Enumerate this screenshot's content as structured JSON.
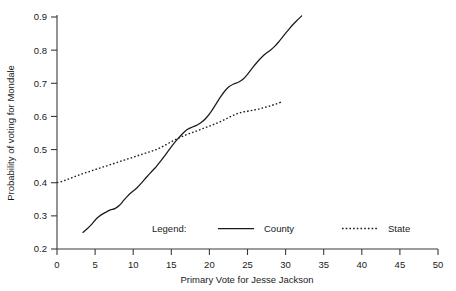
{
  "chart_data": {
    "type": "line",
    "title": "",
    "xlabel": "Primary Vote for Jesse Jackson",
    "ylabel": "Probability of voting for Mondale",
    "xlim": [
      0,
      50
    ],
    "ylim": [
      0.2,
      0.9
    ],
    "xticks": [
      0,
      5,
      10,
      15,
      20,
      25,
      30,
      35,
      40,
      45,
      50
    ],
    "xtick_labels": [
      "0",
      "5",
      "10",
      "15",
      "20",
      "25",
      "30",
      "35",
      "40",
      "45",
      "50"
    ],
    "yticks": [
      0.2,
      0.3,
      0.4,
      0.5,
      0.6,
      0.7,
      0.8,
      0.9
    ],
    "ytick_labels": [
      "0.2",
      "0.3",
      "0.4",
      "0.5",
      "0.6",
      "0.7",
      "0.8",
      "0.9"
    ],
    "grid": false,
    "legend_position": "inside-bottom-center",
    "legend_title": "Legend:",
    "series": [
      {
        "name": "County",
        "style": "solid",
        "color": "#1a1a1a",
        "x": [
          3.4,
          4.0,
          4.6,
          5.2,
          5.8,
          6.4,
          7.0,
          7.6,
          8.2,
          8.8,
          9.4,
          10.0,
          10.6,
          11.2,
          11.8,
          12.4,
          13.0,
          13.6,
          14.2,
          14.8,
          15.4,
          16.0,
          16.6,
          17.2,
          17.8,
          18.4,
          19.0,
          19.6,
          20.2,
          20.8,
          21.4,
          22.0,
          22.6,
          23.2,
          23.8,
          24.4,
          25.0,
          25.6,
          26.2,
          26.8,
          27.4,
          28.0,
          28.6,
          29.2,
          29.8,
          30.4,
          31.0,
          31.6,
          32.1
        ],
        "y": [
          0.25,
          0.262,
          0.276,
          0.292,
          0.303,
          0.311,
          0.318,
          0.322,
          0.332,
          0.348,
          0.363,
          0.375,
          0.387,
          0.402,
          0.418,
          0.433,
          0.448,
          0.465,
          0.483,
          0.502,
          0.52,
          0.536,
          0.551,
          0.562,
          0.568,
          0.574,
          0.583,
          0.596,
          0.614,
          0.635,
          0.657,
          0.676,
          0.69,
          0.698,
          0.703,
          0.712,
          0.727,
          0.745,
          0.762,
          0.777,
          0.79,
          0.8,
          0.812,
          0.828,
          0.845,
          0.862,
          0.878,
          0.892,
          0.903
        ]
      },
      {
        "name": "State",
        "style": "dotted",
        "color": "#1a1a1a",
        "x": [
          0.0,
          0.8,
          1.6,
          2.4,
          3.2,
          4.0,
          4.8,
          5.6,
          6.4,
          7.2,
          8.0,
          8.8,
          9.6,
          10.4,
          11.2,
          12.0,
          12.8,
          13.6,
          14.4,
          15.2,
          16.0,
          16.8,
          17.6,
          18.4,
          19.2,
          20.0,
          20.8,
          21.6,
          22.4,
          23.2,
          24.0,
          24.8,
          25.6,
          26.4,
          27.2,
          28.0,
          28.8,
          29.6
        ],
        "y": [
          0.4,
          0.405,
          0.412,
          0.419,
          0.426,
          0.432,
          0.438,
          0.444,
          0.45,
          0.456,
          0.462,
          0.468,
          0.474,
          0.48,
          0.486,
          0.492,
          0.498,
          0.506,
          0.516,
          0.526,
          0.535,
          0.543,
          0.55,
          0.557,
          0.564,
          0.571,
          0.578,
          0.586,
          0.595,
          0.604,
          0.611,
          0.615,
          0.618,
          0.622,
          0.627,
          0.632,
          0.638,
          0.645
        ]
      }
    ]
  },
  "legend": {
    "title": "Legend:",
    "entries": [
      {
        "label": "County",
        "style": "solid"
      },
      {
        "label": "State",
        "style": "dotted"
      }
    ]
  }
}
